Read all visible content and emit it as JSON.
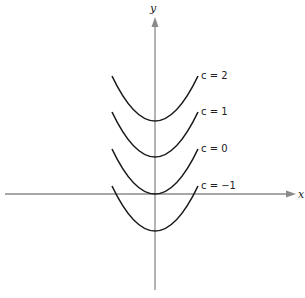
{
  "diagram": {
    "type": "family-of-parabolas",
    "axes": {
      "x_label": "x",
      "y_label": "y",
      "axis_color": "#8a8a8a",
      "curve_color": "#1a1a1a"
    },
    "curves": [
      {
        "label": "c = 2",
        "c": 2,
        "vertex_y": 121
      },
      {
        "label": "c = 1",
        "c": 1,
        "vertex_y": 157
      },
      {
        "label": "c = 0",
        "c": 0,
        "vertex_y": 194
      },
      {
        "label": "c = −1",
        "c": -1,
        "vertex_y": 231
      }
    ]
  }
}
